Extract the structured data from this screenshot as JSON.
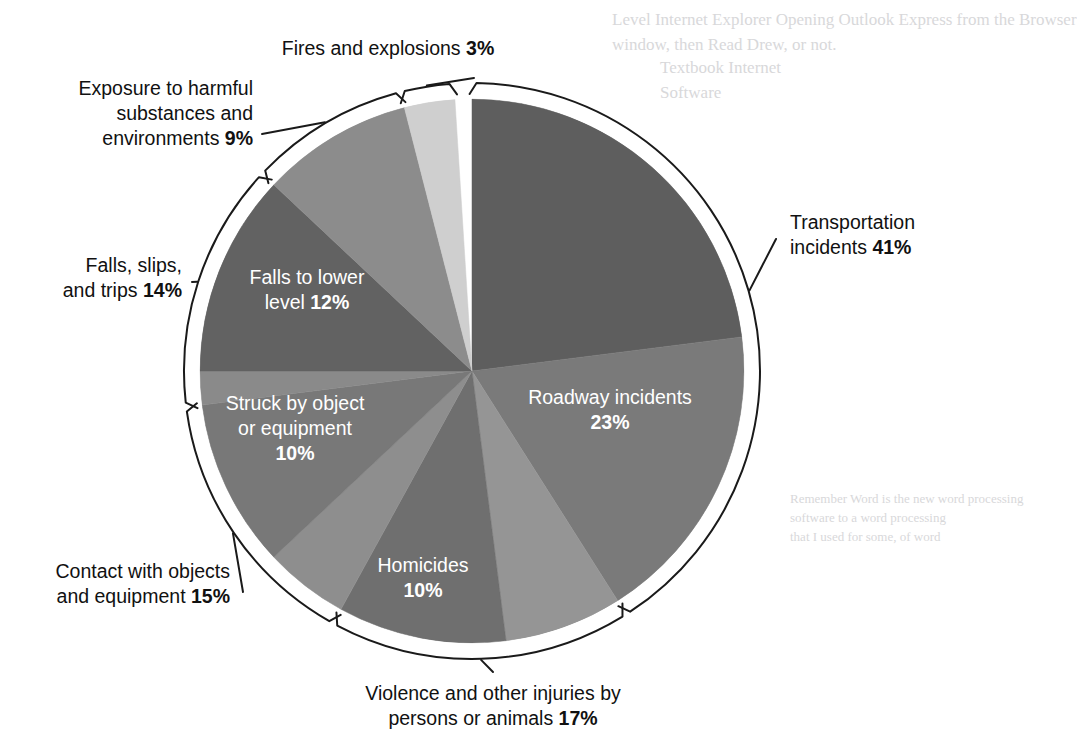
{
  "figure": {
    "background_color": "#ffffff",
    "outline_color": "#1a1a1a",
    "paper_tint": "#fbfbfb"
  },
  "chart_data": {
    "type": "pie",
    "title": "",
    "subtitle": "",
    "xlabel": "",
    "ylabel": "",
    "units": "percent",
    "total": 100,
    "legend_position": "callouts",
    "grid": false,
    "start_angle_deg": 0,
    "direction": "clockwise",
    "categories": [
      "Transportation incidents",
      "Violence and other injuries by persons or animals",
      "Contact with objects and equipment",
      "Falls, slips, and trips",
      "Exposure to harmful substances and environments",
      "Fires and explosions"
    ],
    "values": [
      41,
      17,
      15,
      14,
      9,
      3
    ],
    "groups": [
      {
        "name": "Transportation incidents",
        "value": 41,
        "label": "Transportation incidents",
        "pct_label": "41%",
        "subslices": [
          {
            "name": "Roadway incidents",
            "value": 23,
            "pct_label": "23%",
            "color": "#5e5e5e",
            "inside_label": true
          },
          {
            "name": "Other transportation incidents",
            "value": 18,
            "pct_label": "",
            "color": "#7a7a7a",
            "inside_label": false
          }
        ]
      },
      {
        "name": "Violence and other injuries by persons or animals",
        "value": 17,
        "label": "Violence and other injuries by persons or animals",
        "pct_label": "17%",
        "subslices": [
          {
            "name": "Other violence",
            "value": 7,
            "pct_label": "",
            "color": "#959595",
            "inside_label": false
          },
          {
            "name": "Homicides",
            "value": 10,
            "pct_label": "10%",
            "color": "#6f6f6f",
            "inside_label": true
          }
        ]
      },
      {
        "name": "Contact with objects and equipment",
        "value": 15,
        "label": "Contact with objects and equipment",
        "pct_label": "15%",
        "subslices": [
          {
            "name": "Other contact with objects",
            "value": 5,
            "pct_label": "",
            "color": "#8e8e8e",
            "inside_label": false
          },
          {
            "name": "Struck by object or equipment",
            "value": 10,
            "pct_label": "10%",
            "color": "#787878",
            "inside_label": true
          }
        ]
      },
      {
        "name": "Falls, slips, and trips",
        "value": 14,
        "label": "Falls, slips, and trips",
        "pct_label": "14%",
        "subslices": [
          {
            "name": "Other falls slips and trips",
            "value": 2,
            "pct_label": "",
            "color": "#8a8a8a",
            "inside_label": false
          },
          {
            "name": "Falls to lower level",
            "value": 12,
            "pct_label": "12%",
            "color": "#626262",
            "inside_label": true
          }
        ]
      },
      {
        "name": "Exposure to harmful substances and environments",
        "value": 9,
        "label": "Exposure to harmful substances and environments",
        "pct_label": "9%",
        "subslices": [
          {
            "name": "Exposure to harmful substances and environments",
            "value": 9,
            "pct_label": "",
            "color": "#8c8c8c",
            "inside_label": false
          }
        ]
      },
      {
        "name": "Fires and explosions",
        "value": 3,
        "label": "Fires and explosions",
        "pct_label": "3%",
        "subslices": [
          {
            "name": "Fires and explosions",
            "value": 3,
            "pct_label": "",
            "color": "#cfcfcf",
            "inside_label": false
          }
        ]
      }
    ],
    "inside_labels": [
      {
        "id": "roadway",
        "line1": "Roadway incidents",
        "line2_bold": "23%",
        "x": 610,
        "y": 404
      },
      {
        "id": "homicides",
        "line1": "Homicides",
        "line2_bold": "10%",
        "x": 423,
        "y": 572
      },
      {
        "id": "struck-by",
        "line1": "Struck by object",
        "line2": "or equipment",
        "line3_bold": "10%",
        "x": 295,
        "y": 410
      },
      {
        "id": "falls-lower",
        "line1": "Falls to lower",
        "line2": "level ",
        "line2_bold": "12%",
        "x": 307,
        "y": 284
      }
    ],
    "callouts": [
      {
        "id": "fires-and-explosions",
        "lines": [
          {
            "text": "Fires and explosions ",
            "bold": "3%"
          }
        ],
        "anchor": "middle",
        "x": 388,
        "y": 55
      },
      {
        "id": "exposure-harmful",
        "lines": [
          {
            "text": "Exposure to harmful",
            "bold": ""
          },
          {
            "text": "substances and",
            "bold": ""
          },
          {
            "text": "environments ",
            "bold": "9%"
          }
        ],
        "anchor": "end",
        "x": 253,
        "y": 95
      },
      {
        "id": "falls-slips-trips",
        "lines": [
          {
            "text": "Falls, slips,",
            "bold": ""
          },
          {
            "text": "and trips ",
            "bold": "14%"
          }
        ],
        "anchor": "end",
        "x": 182,
        "y": 272
      },
      {
        "id": "contact-objects",
        "lines": [
          {
            "text": "Contact with objects",
            "bold": ""
          },
          {
            "text": "and equipment ",
            "bold": "15%"
          }
        ],
        "anchor": "end",
        "x": 230,
        "y": 578
      },
      {
        "id": "violence-persons-animals",
        "lines": [
          {
            "text": "Violence and other injuries by",
            "bold": ""
          },
          {
            "text": "persons or animals ",
            "bold": "17%"
          }
        ],
        "anchor": "middle",
        "x": 493,
        "y": 700
      },
      {
        "id": "transportation-incidents",
        "lines": [
          {
            "text": "Transportation",
            "bold": ""
          },
          {
            "text": "incidents ",
            "bold": "41%"
          }
        ],
        "anchor": "start",
        "x": 790,
        "y": 229
      }
    ]
  },
  "bleed_through": {
    "top_right_block": "Level Internet Explorer Opening Outlook Express from the Browser\nwindow, then Read Drew, or not.",
    "top_right_block2": "Textbook Internet\nSoftware",
    "lower_right_block": "Remember Word is the new word processing\nsoftware to a word processing\nthat I used for some, of word"
  }
}
